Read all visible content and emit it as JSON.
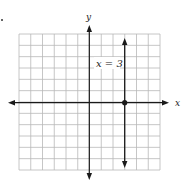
{
  "chart_data": {
    "type": "line",
    "title": "",
    "xlabel": "x",
    "ylabel": "y",
    "xlim": [
      -6,
      6
    ],
    "ylim": [
      -6,
      6
    ],
    "grid": true,
    "series": [
      {
        "name": "x = 3",
        "kind": "vertical-line",
        "x": [
          3,
          3
        ],
        "y": [
          -5.8,
          5.7
        ],
        "arrows": "both"
      }
    ],
    "points": [
      {
        "x": 3,
        "y": 0,
        "style": "filled-dot"
      }
    ],
    "annotations": [
      {
        "text": "x = 3",
        "x": 1.2,
        "y": 3.3
      }
    ]
  },
  "labels": {
    "x_axis": "x",
    "y_axis": "y",
    "line_label": "x = 3",
    "item_marker": "."
  },
  "colors": {
    "grid": "#b8b8b8",
    "axis": "#1a1a1a",
    "background": "#ffffff"
  }
}
